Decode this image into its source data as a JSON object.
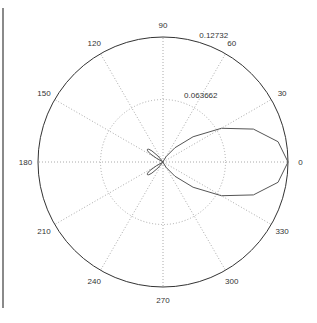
{
  "chart_data": {
    "type": "polar-line",
    "title": "",
    "rlim": [
      0,
      0.12732
    ],
    "r_ticks": [
      {
        "value": 0.063662,
        "label": "0.063662"
      },
      {
        "value": 0.12732,
        "label": "0.12732"
      }
    ],
    "theta_ticks": [
      {
        "value": 0,
        "label": "0"
      },
      {
        "value": 30,
        "label": "30"
      },
      {
        "value": 60,
        "label": "60"
      },
      {
        "value": 90,
        "label": "90"
      },
      {
        "value": 120,
        "label": "120"
      },
      {
        "value": 150,
        "label": "150"
      },
      {
        "value": 180,
        "label": "180"
      },
      {
        "value": 210,
        "label": "210"
      },
      {
        "value": 240,
        "label": "240"
      },
      {
        "value": 270,
        "label": "270"
      },
      {
        "value": 300,
        "label": "300"
      },
      {
        "value": 330,
        "label": "330"
      }
    ],
    "grid": true,
    "series": [
      {
        "name": "pattern",
        "color": "#555555",
        "theta_deg": [
          -90,
          -80,
          -70,
          -60,
          -50,
          -40,
          -30,
          -20,
          -10,
          0,
          10,
          20,
          30,
          40,
          50,
          60,
          70,
          80,
          90,
          125,
          130,
          135,
          138,
          141,
          144,
          147,
          150,
          155,
          205,
          210,
          213,
          216,
          219,
          222,
          225,
          230,
          235
        ],
        "r": [
          0,
          0.0001,
          0.001,
          0.0063,
          0.019,
          0.04,
          0.0687,
          0.098,
          0.119,
          0.12732,
          0.119,
          0.098,
          0.0687,
          0.04,
          0.019,
          0.0063,
          0.001,
          0.0001,
          0,
          0,
          0.008,
          0.016,
          0.0195,
          0.0205,
          0.0195,
          0.016,
          0.008,
          0,
          0,
          0.008,
          0.016,
          0.0195,
          0.0205,
          0.0195,
          0.016,
          0.008,
          0
        ]
      }
    ]
  },
  "colors": {
    "frame_line": "#8a8a8a",
    "axis_circle": "#333333",
    "grid": "#aaaaaa",
    "curve": "#555555"
  }
}
